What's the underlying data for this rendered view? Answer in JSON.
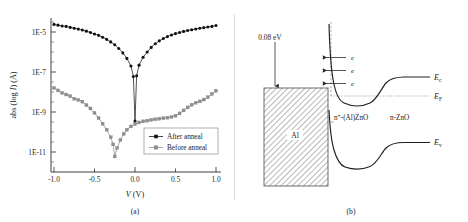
{
  "figure": {
    "panel_a_caption": "(a)",
    "panel_b_caption": "(b)"
  },
  "panel_a": {
    "ylabel": "abs (log I) (A)",
    "xlabel": "V (V)",
    "xlabel_italic": "V",
    "xlabel_unit": " (V)",
    "ylabel_part1": "abs (log ",
    "ylabel_part2": "I",
    "ylabel_part3": ") (A)",
    "legend": [
      {
        "label": "After anneal",
        "color": "#111111",
        "marker": "circle"
      },
      {
        "label": "Before anneal",
        "color": "#8f8f8f",
        "marker": "square"
      }
    ],
    "ytick_labels": [
      "1E-5",
      "1E-7",
      "1E-9",
      "1E-11"
    ],
    "xtick_labels": [
      "-1.0",
      "-0.5",
      "0.0",
      "0.5",
      "1.0"
    ]
  },
  "chart_data": {
    "type": "line",
    "title": "",
    "xlabel": "V (V)",
    "ylabel": "abs (log I) (A)",
    "yscale": "log",
    "xlim": [
      -1.05,
      1.05
    ],
    "ylim": [
      1e-13,
      0.0001
    ],
    "ytick_values": [
      1e-05,
      1e-07,
      1e-09,
      1e-11
    ],
    "xtick_values": [
      -1.0,
      -0.5,
      0.0,
      0.5,
      1.0
    ],
    "grid": false,
    "legend_position": "lower-right",
    "series": [
      {
        "name": "After anneal",
        "color": "#111111",
        "marker": "circle",
        "x": [
          -1.0,
          -0.95,
          -0.9,
          -0.85,
          -0.8,
          -0.75,
          -0.7,
          -0.65,
          -0.6,
          -0.55,
          -0.5,
          -0.45,
          -0.4,
          -0.35,
          -0.3,
          -0.25,
          -0.2,
          -0.15,
          -0.1,
          -0.05,
          -0.02,
          0.0,
          0.02,
          0.05,
          0.1,
          0.15,
          0.2,
          0.25,
          0.3,
          0.35,
          0.4,
          0.45,
          0.5,
          0.55,
          0.6,
          0.65,
          0.7,
          0.75,
          0.8,
          0.85,
          0.9,
          0.95,
          1.0
        ],
        "y": [
          2.4e-05,
          2.2e-05,
          2e-05,
          1.9e-05,
          1.7e-05,
          1.55e-05,
          1.4e-05,
          1.25e-05,
          1.1e-05,
          9.5e-06,
          8e-06,
          6.8e-06,
          5.5e-06,
          4.3e-06,
          3.2e-06,
          2.3e-06,
          1.5e-06,
          9e-07,
          4.8e-07,
          2e-07,
          6e-08,
          3.5e-10,
          6.5e-08,
          2.2e-07,
          5.5e-07,
          1e-06,
          1.7e-06,
          2.6e-06,
          3.6e-06,
          4.7e-06,
          5.9e-06,
          7.1e-06,
          8.3e-06,
          9.5e-06,
          1.07e-05,
          1.19e-05,
          1.3e-05,
          1.42e-05,
          1.53e-05,
          1.65e-05,
          1.78e-05,
          1.9e-05,
          2.1e-05
        ]
      },
      {
        "name": "Before anneal",
        "color": "#8f8f8f",
        "marker": "square",
        "x": [
          -1.0,
          -0.95,
          -0.9,
          -0.85,
          -0.8,
          -0.75,
          -0.7,
          -0.65,
          -0.6,
          -0.55,
          -0.5,
          -0.45,
          -0.4,
          -0.35,
          -0.3,
          -0.27,
          -0.25,
          -0.22,
          -0.18,
          -0.14,
          -0.1,
          -0.05,
          0.0,
          0.05,
          0.1,
          0.15,
          0.2,
          0.25,
          0.3,
          0.35,
          0.4,
          0.45,
          0.5,
          0.55,
          0.6,
          0.65,
          0.7,
          0.75,
          0.8,
          0.85,
          0.9,
          0.95,
          1.0
        ],
        "y": [
          1.6e-08,
          1.2e-08,
          9e-09,
          7.5e-09,
          6.2e-09,
          4.6e-09,
          4e-09,
          3.3e-09,
          2.2e-09,
          1.5e-09,
          9e-10,
          5e-10,
          2.6e-10,
          1.3e-10,
          5.5e-11,
          2.4e-11,
          6e-12,
          1.6e-11,
          4e-11,
          8e-11,
          1.3e-10,
          1.9e-10,
          2.5e-10,
          3e-10,
          3.4e-10,
          3.7e-10,
          4e-10,
          4.3e-10,
          4.6e-10,
          4.9e-10,
          5.2e-10,
          5.6e-10,
          6.5e-10,
          8.5e-10,
          1.2e-09,
          1.7e-09,
          2.3e-09,
          2.9e-09,
          3.4e-09,
          4.2e-09,
          5.5e-09,
          8e-09,
          1.15e-08
        ]
      }
    ]
  },
  "panel_b": {
    "energy_arrow_label": "0.08 eV",
    "metal_label": "Al",
    "region_left_label": "n+-(Al)ZnO",
    "region_left_sup": "+",
    "region_left_prefix": "n",
    "region_left_suffix": "-(Al)ZnO",
    "region_right_label": "n-ZnO",
    "electron_labels": [
      "e",
      "e",
      "e"
    ],
    "levels": [
      {
        "symbol": "E",
        "sub": "c",
        "name": "conduction-band"
      },
      {
        "symbol": "E",
        "sub": "F",
        "name": "fermi-level"
      },
      {
        "symbol": "E",
        "sub": "v",
        "name": "valence-band"
      }
    ]
  }
}
